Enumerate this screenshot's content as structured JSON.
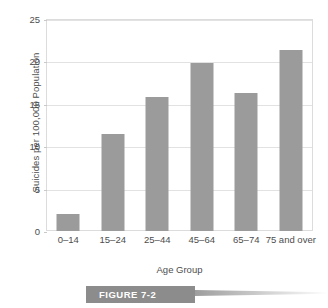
{
  "chart_data": {
    "type": "bar",
    "title": "",
    "xlabel": "Age Group",
    "ylabel": "Suicides per 100,000 Population",
    "categories": [
      "0–14",
      "15–24",
      "25–44",
      "45–64",
      "65–74",
      "75 and over"
    ],
    "values": [
      2.0,
      11.4,
      15.8,
      19.8,
      16.3,
      21.4
    ],
    "ylim": [
      0,
      25
    ],
    "yticks": [
      0,
      5,
      10,
      15,
      20,
      25
    ],
    "ytick_labels": [
      "0",
      "5",
      "10",
      "15",
      "20",
      "25"
    ],
    "grid": true,
    "legend": false,
    "bar_color": "#9a9b9a",
    "gridline_color": "#e2e2e2",
    "frame_color": "#dcdcdc"
  },
  "caption": {
    "label": "FIGURE 7-2",
    "block_color": "#8c8c8c",
    "text_color": "#ffffff"
  }
}
